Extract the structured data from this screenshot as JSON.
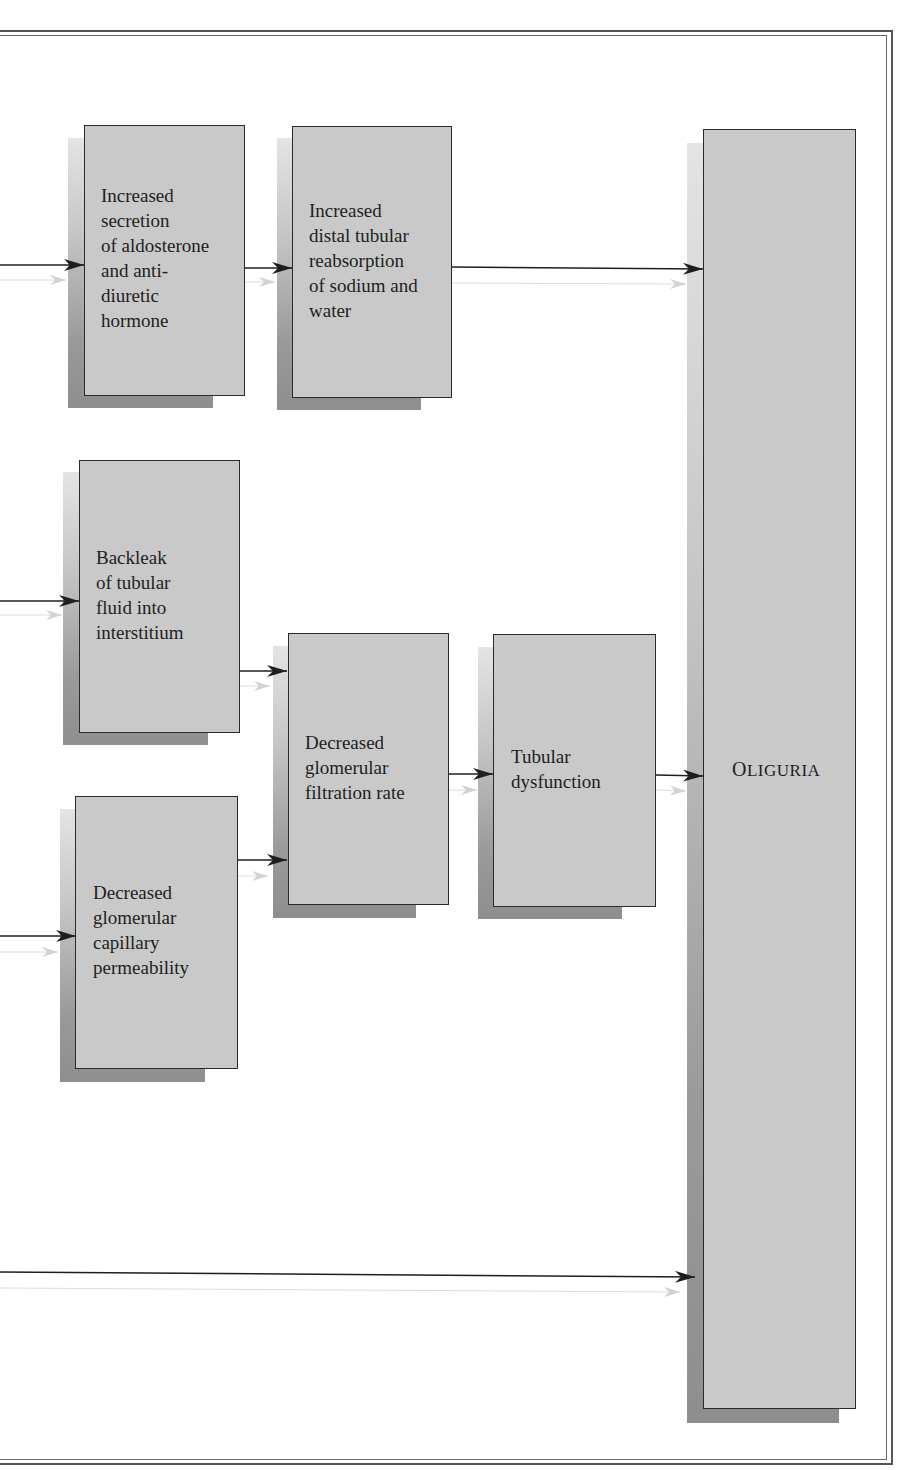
{
  "diagram": {
    "type": "flowchart",
    "title": "",
    "page_header": {
      "text": ""
    },
    "nodes": [
      {
        "id": "aldosterone",
        "label": "Increased\nsecretion\nof aldosterone\nand anti-\ndiuretic\nhormone"
      },
      {
        "id": "distal_reabsorption",
        "label": "Increased\ndistal tubular\nreabsorption\nof sodium and\nwater"
      },
      {
        "id": "backleak",
        "label": "Backleak\nof tubular\nfluid into\ninterstitium"
      },
      {
        "id": "decreased_gfr",
        "label": "Decreased\nglomerular\nfiltration rate"
      },
      {
        "id": "tubular_dysfunction",
        "label": "Tubular\ndysfunction"
      },
      {
        "id": "decreased_permeability",
        "label": "Decreased\nglomerular\ncapillary\npermeability"
      },
      {
        "id": "oliguria",
        "label_first": "O",
        "label_rest": "LIGURIA",
        "label": "OLIGURIA"
      }
    ],
    "edges": [
      {
        "from": "offpage-left-1",
        "to": "aldosterone"
      },
      {
        "from": "aldosterone",
        "to": "distal_reabsorption"
      },
      {
        "from": "distal_reabsorption",
        "to": "oliguria"
      },
      {
        "from": "offpage-left-2",
        "to": "backleak"
      },
      {
        "from": "backleak",
        "to": "decreased_gfr"
      },
      {
        "from": "offpage-left-3",
        "to": "decreased_permeability"
      },
      {
        "from": "decreased_permeability",
        "to": "decreased_gfr"
      },
      {
        "from": "decreased_gfr",
        "to": "tubular_dysfunction"
      },
      {
        "from": "tubular_dysfunction",
        "to": "oliguria"
      },
      {
        "from": "offpage-left-4",
        "to": "oliguria"
      }
    ],
    "colors": {
      "box_fill": "#c9c9c9",
      "box_border": "#2a2a2a",
      "arrow": "#1e1e1e",
      "ghost_arrow": "#cfcfcf",
      "frame": "#555555"
    }
  }
}
